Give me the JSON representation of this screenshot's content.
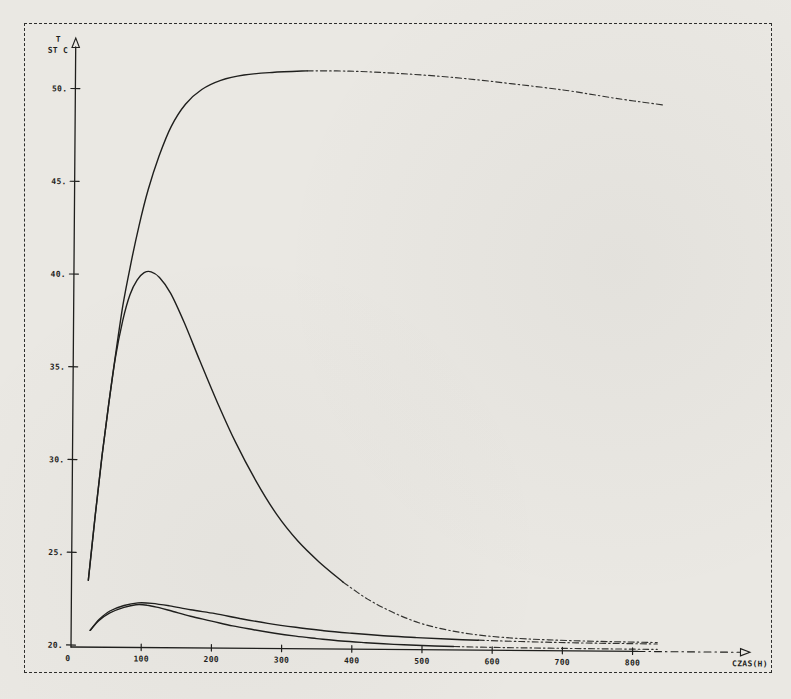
{
  "page": {
    "kind": "scanned plotter chart",
    "paper_color": "#eae8e3",
    "ink_color": "#1f1f1d",
    "frame_color": "#2e2e2c"
  },
  "chart_data": {
    "type": "line",
    "title": "",
    "ylabel_line1": "T",
    "ylabel_line2": "ST C",
    "xlabel": "CZAS(H)",
    "xlim": [
      0,
      960
    ],
    "ylim": [
      20,
      52.8
    ],
    "grid": false,
    "legend": "none",
    "x_ticks": [
      {
        "v": 0,
        "label": "0"
      },
      {
        "v": 100,
        "label": "100"
      },
      {
        "v": 200,
        "label": "200"
      },
      {
        "v": 300,
        "label": "300"
      },
      {
        "v": 400,
        "label": "400"
      },
      {
        "v": 500,
        "label": "500"
      },
      {
        "v": 600,
        "label": "600"
      },
      {
        "v": 700,
        "label": "700"
      },
      {
        "v": 800,
        "label": "800"
      }
    ],
    "y_ticks": [
      {
        "v": 20,
        "label": "20."
      },
      {
        "v": 25,
        "label": "25."
      },
      {
        "v": 30,
        "label": "30."
      },
      {
        "v": 35,
        "label": "35."
      },
      {
        "v": 40,
        "label": "40."
      },
      {
        "v": 45,
        "label": "45."
      },
      {
        "v": 50,
        "label": "50."
      }
    ],
    "series": [
      {
        "name": "heating-curve-plateau-51C",
        "dash_from_x": 340,
        "points": [
          [
            24,
            23.5
          ],
          [
            33,
            27.0
          ],
          [
            42,
            30.2
          ],
          [
            51,
            33.0
          ],
          [
            60,
            35.6
          ],
          [
            70,
            38.3
          ],
          [
            80,
            40.4
          ],
          [
            92,
            42.6
          ],
          [
            105,
            44.6
          ],
          [
            120,
            46.4
          ],
          [
            137,
            48.0
          ],
          [
            157,
            49.2
          ],
          [
            180,
            50.0
          ],
          [
            207,
            50.5
          ],
          [
            240,
            50.8
          ],
          [
            280,
            50.95
          ],
          [
            330,
            51.05
          ],
          [
            390,
            51.05
          ],
          [
            460,
            50.95
          ],
          [
            540,
            50.75
          ],
          [
            620,
            50.45
          ],
          [
            700,
            50.1
          ],
          [
            770,
            49.7
          ],
          [
            840,
            49.35
          ]
        ]
      },
      {
        "name": "heating-curve-peak-40C",
        "dash_from_x": 400,
        "points": [
          [
            24,
            23.5
          ],
          [
            33,
            27.0
          ],
          [
            42,
            30.2
          ],
          [
            51,
            33.0
          ],
          [
            60,
            35.5
          ],
          [
            70,
            37.5
          ],
          [
            80,
            38.9
          ],
          [
            90,
            39.7
          ],
          [
            100,
            40.1
          ],
          [
            110,
            40.15
          ],
          [
            122,
            39.85
          ],
          [
            138,
            39.0
          ],
          [
            158,
            37.4
          ],
          [
            180,
            35.4
          ],
          [
            205,
            33.2
          ],
          [
            232,
            31.0
          ],
          [
            262,
            28.9
          ],
          [
            292,
            27.1
          ],
          [
            322,
            25.7
          ],
          [
            352,
            24.6
          ],
          [
            387,
            23.5
          ],
          [
            422,
            22.6
          ],
          [
            458,
            21.9
          ],
          [
            495,
            21.35
          ],
          [
            532,
            21.0
          ],
          [
            572,
            20.75
          ],
          [
            620,
            20.58
          ],
          [
            680,
            20.48
          ],
          [
            750,
            20.42
          ],
          [
            835,
            20.38
          ]
        ]
      },
      {
        "name": "low-curve-slow-decay",
        "dash_from_x": 620,
        "points": [
          [
            27,
            20.8
          ],
          [
            40,
            21.4
          ],
          [
            55,
            21.85
          ],
          [
            75,
            22.15
          ],
          [
            95,
            22.3
          ],
          [
            115,
            22.28
          ],
          [
            140,
            22.15
          ],
          [
            170,
            21.95
          ],
          [
            205,
            21.75
          ],
          [
            240,
            21.5
          ],
          [
            280,
            21.25
          ],
          [
            320,
            21.05
          ],
          [
            360,
            20.88
          ],
          [
            400,
            20.75
          ],
          [
            445,
            20.63
          ],
          [
            490,
            20.55
          ],
          [
            535,
            20.48
          ],
          [
            580,
            20.43
          ],
          [
            640,
            20.38
          ],
          [
            720,
            20.33
          ],
          [
            835,
            20.3
          ]
        ]
      },
      {
        "name": "low-curve-fast-decay",
        "dash_from_x": 560,
        "points": [
          [
            27,
            20.8
          ],
          [
            40,
            21.35
          ],
          [
            55,
            21.75
          ],
          [
            75,
            22.05
          ],
          [
            92,
            22.2
          ],
          [
            108,
            22.18
          ],
          [
            125,
            22.05
          ],
          [
            145,
            21.85
          ],
          [
            170,
            21.6
          ],
          [
            200,
            21.35
          ],
          [
            230,
            21.1
          ],
          [
            260,
            20.9
          ],
          [
            290,
            20.72
          ],
          [
            320,
            20.57
          ],
          [
            350,
            20.45
          ],
          [
            385,
            20.33
          ],
          [
            420,
            20.25
          ],
          [
            460,
            20.17
          ],
          [
            500,
            20.12
          ],
          [
            545,
            20.08
          ],
          [
            600,
            20.05
          ],
          [
            680,
            20.03
          ],
          [
            835,
            20.01
          ]
        ]
      }
    ]
  }
}
